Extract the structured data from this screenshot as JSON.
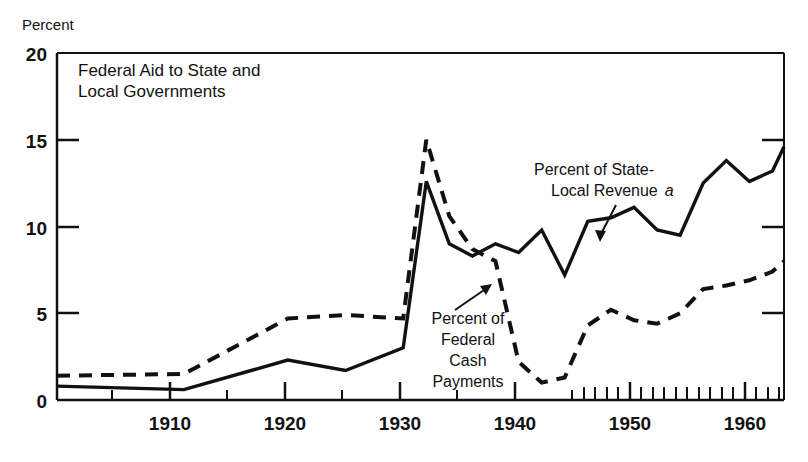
{
  "figure": {
    "y_axis_title": "Percent",
    "plot_title_line1": "Federal Aid to State and",
    "plot_title_line2": "Local Governments"
  },
  "annotations": {
    "series_a_line1": "Percent of State-",
    "series_a_line2": "Local Revenue",
    "series_a_footnote": "a",
    "series_b_line1": "Percent of",
    "series_b_line2": "Federal",
    "series_b_line3": "Cash",
    "series_b_line4": "Payments"
  },
  "chart_data": {
    "type": "line",
    "xlabel": "",
    "ylabel": "Percent",
    "xlim": [
      1902,
      1965
    ],
    "ylim": [
      0,
      20
    ],
    "yticks": [
      0,
      5,
      10,
      15,
      20
    ],
    "ytick_labels": [
      "0",
      "5",
      "10",
      "15",
      "20"
    ],
    "xticks_major": [
      1910,
      1920,
      1930,
      1940,
      1950,
      1960
    ],
    "xtick_labels": [
      "1910",
      "1920",
      "1930",
      "1940",
      "1950",
      "1960"
    ],
    "xticks_minor": [
      1905,
      1915,
      1925,
      1935,
      1945,
      1955,
      1956,
      1957,
      1958,
      1959,
      1961,
      1962,
      1963,
      1964,
      1965
    ],
    "xticks_annual_start": 1951,
    "grid": false,
    "legend": "inline-annotations",
    "series": [
      {
        "name": "Percent of State-Local Revenue",
        "style": "solid",
        "x": [
          1902,
          1913,
          1922,
          1927,
          1932,
          1934,
          1936,
          1938,
          1940,
          1942,
          1944,
          1946,
          1948,
          1950,
          1952,
          1954,
          1956,
          1958,
          1960,
          1962,
          1964,
          1965
        ],
        "y": [
          0.8,
          0.6,
          2.3,
          1.7,
          3.0,
          12.6,
          9.0,
          8.3,
          9.0,
          8.5,
          9.8,
          7.2,
          10.3,
          10.5,
          11.1,
          9.8,
          9.5,
          12.5,
          13.8,
          12.6,
          13.2,
          14.6
        ]
      },
      {
        "name": "Percent of Federal Cash Payments",
        "style": "dashed",
        "x": [
          1902,
          1913,
          1922,
          1927,
          1932,
          1934,
          1936,
          1938,
          1940,
          1942,
          1944,
          1946,
          1948,
          1950,
          1952,
          1954,
          1956,
          1958,
          1960,
          1962,
          1964,
          1965
        ],
        "y": [
          1.4,
          1.5,
          4.7,
          4.9,
          4.7,
          15.0,
          10.6,
          8.7,
          8.0,
          2.2,
          1.0,
          1.3,
          4.3,
          5.2,
          4.6,
          4.4,
          5.0,
          6.4,
          6.6,
          6.9,
          7.4,
          8.0
        ]
      }
    ]
  }
}
